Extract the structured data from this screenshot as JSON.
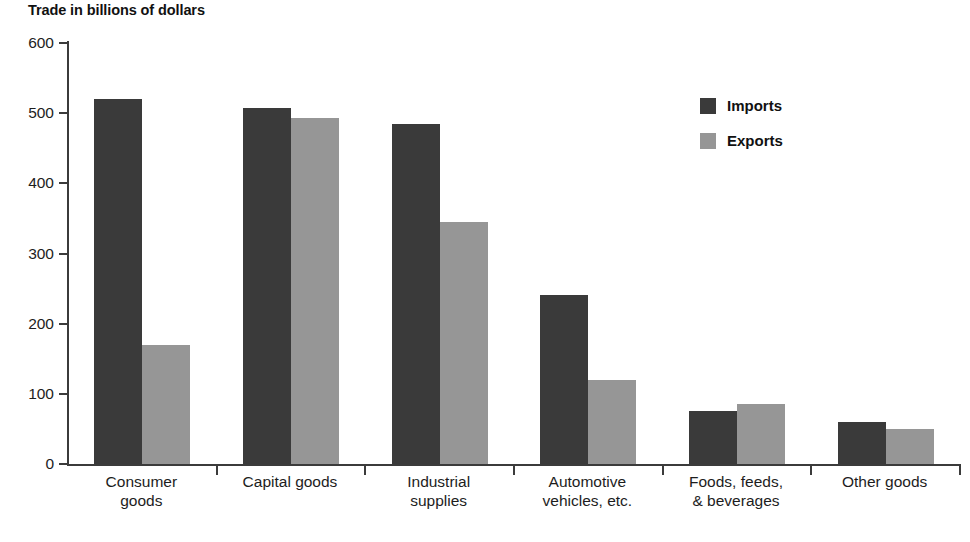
{
  "chart_data": {
    "type": "bar",
    "title": "Trade in billions of dollars",
    "xlabel": "",
    "ylabel": "",
    "ylim": [
      0,
      600
    ],
    "yticks": [
      0,
      100,
      200,
      300,
      400,
      500,
      600
    ],
    "grid": false,
    "legend_position": "upper right",
    "categories": [
      "Consumer goods",
      "Capital goods",
      "Industrial supplies",
      "Automotive vehicles, etc.",
      "Foods, feeds, & beverages",
      "Other goods"
    ],
    "category_lines": [
      [
        "Consumer",
        "goods"
      ],
      [
        "Capital goods",
        ""
      ],
      [
        "Industrial",
        "supplies"
      ],
      [
        "Automotive",
        "vehicles, etc."
      ],
      [
        "Foods, feeds,",
        "& beverages"
      ],
      [
        "Other goods",
        ""
      ]
    ],
    "series": [
      {
        "name": "Imports",
        "color": "#3a3a3a",
        "values": [
          520,
          508,
          485,
          241,
          76,
          60
        ]
      },
      {
        "name": "Exports",
        "color": "#969696",
        "values": [
          170,
          493,
          345,
          120,
          85,
          50
        ]
      }
    ]
  },
  "legend": {
    "items": [
      {
        "label": "Imports",
        "color": "#3a3a3a"
      },
      {
        "label": "Exports",
        "color": "#969696"
      }
    ]
  },
  "axis": {
    "tick_labels": [
      "600",
      "500",
      "400",
      "300",
      "200",
      "100",
      "0"
    ]
  },
  "colors": {
    "imports": "#3a3a3a",
    "exports": "#969696",
    "axis": "#3b3b3b",
    "text": "#1d1d1d",
    "background": "#ffffff"
  }
}
